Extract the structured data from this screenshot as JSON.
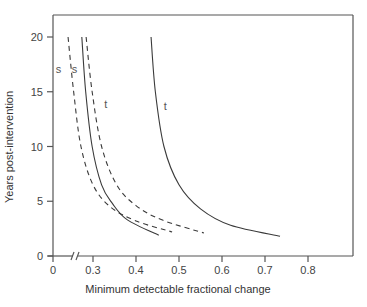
{
  "chart_data": {
    "type": "line",
    "title": "",
    "xlabel": "Minimum detectable fractional change",
    "ylabel": "Years post-intervention",
    "xlim": [
      0,
      0.9
    ],
    "ylim": [
      0,
      22
    ],
    "x_axis_break": true,
    "x_ticks": [
      {
        "value": 0,
        "label": "0"
      },
      {
        "value": 0.3,
        "label": "0.3"
      },
      {
        "value": 0.4,
        "label": "0.4"
      },
      {
        "value": 0.5,
        "label": "0.5"
      },
      {
        "value": 0.6,
        "label": "0.6"
      },
      {
        "value": 0.7,
        "label": "0.7"
      },
      {
        "value": 0.8,
        "label": "0.8"
      }
    ],
    "y_ticks": [
      {
        "value": 0,
        "label": "0"
      },
      {
        "value": 5,
        "label": "5"
      },
      {
        "value": 10,
        "label": "10"
      },
      {
        "value": 15,
        "label": "15"
      },
      {
        "value": 20,
        "label": "20"
      }
    ],
    "grid": false,
    "legend": null,
    "series": [
      {
        "name": "s (dashed, inner)",
        "style": "dashed",
        "label": "s",
        "points": [
          [
            0.242,
            20
          ],
          [
            0.255,
            15
          ],
          [
            0.272,
            10
          ],
          [
            0.3,
            6.5
          ],
          [
            0.34,
            4.5
          ],
          [
            0.4,
            3.2
          ],
          [
            0.484,
            2.2
          ]
        ]
      },
      {
        "name": "t (solid, inner)",
        "style": "solid",
        "label": "t",
        "points": [
          [
            0.274,
            20
          ],
          [
            0.283,
            15
          ],
          [
            0.298,
            10
          ],
          [
            0.32,
            6.5
          ],
          [
            0.345,
            4.8
          ],
          [
            0.38,
            3.3
          ],
          [
            0.453,
            1.9
          ]
        ]
      },
      {
        "name": "s (dashed, outer)",
        "style": "dashed",
        "label": "s",
        "points": [
          [
            0.284,
            20
          ],
          [
            0.298,
            15
          ],
          [
            0.32,
            10
          ],
          [
            0.355,
            6.5
          ],
          [
            0.4,
            4.6
          ],
          [
            0.46,
            3.3
          ],
          [
            0.558,
            2.1
          ]
        ]
      },
      {
        "name": "t (solid, outer)",
        "style": "solid",
        "label": "t",
        "points": [
          [
            0.435,
            20
          ],
          [
            0.445,
            15
          ],
          [
            0.465,
            10
          ],
          [
            0.5,
            6.5
          ],
          [
            0.55,
            4.3
          ],
          [
            0.62,
            2.8
          ],
          [
            0.735,
            1.8
          ]
        ]
      }
    ],
    "annotations": [
      {
        "text": "s",
        "x": 0.22,
        "y": 16.7
      },
      {
        "text": "s",
        "x": 0.257,
        "y": 16.7
      },
      {
        "text": "t",
        "x": 0.33,
        "y": 13.5
      },
      {
        "text": "t",
        "x": 0.468,
        "y": 13.3
      }
    ]
  },
  "labels": {
    "xlabel": "Minimum detectable fractional change",
    "ylabel": "Years post-intervention"
  },
  "colors": {
    "axis": "#555555",
    "curve": "#3a3a3a",
    "text": "#444444"
  }
}
